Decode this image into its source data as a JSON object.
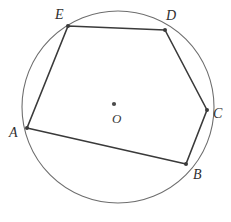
{
  "figure": {
    "type": "inscribed-polygon-in-circle",
    "background_color": "#ffffff",
    "circle": {
      "name": "circumscribed-circle",
      "center_x": 118,
      "center_y": 107,
      "radius": 96,
      "stroke_color": "#6e6e6e",
      "stroke_width": 1.1,
      "fill": "none"
    },
    "center_point": {
      "label": "O",
      "dot_x": 114,
      "dot_y": 104,
      "dot_radius": 2.1,
      "dot_color": "#4a4a4a",
      "label_x": 112,
      "label_y": 112
    },
    "polygon": {
      "name": "pentagon-ABCDE",
      "stroke_color": "#3a3a3a",
      "stroke_width": 1.6,
      "fill": "none",
      "points": "27,128 186,164 207,110 165,30 68,26",
      "vertices": [
        {
          "label": "A",
          "x": 27,
          "y": 128,
          "label_x": 9,
          "label_y": 126
        },
        {
          "label": "B",
          "x": 186,
          "y": 164,
          "label_x": 193,
          "label_y": 168
        },
        {
          "label": "C",
          "x": 207,
          "y": 110,
          "label_x": 213,
          "label_y": 107
        },
        {
          "label": "D",
          "x": 165,
          "y": 30,
          "label_x": 166,
          "label_y": 9
        },
        {
          "label": "E",
          "x": 68,
          "y": 26,
          "label_x": 55,
          "label_y": 8
        }
      ],
      "edges": [
        {
          "name": "edge-AB",
          "from": "A",
          "to": "B"
        },
        {
          "name": "edge-BC",
          "from": "B",
          "to": "C"
        },
        {
          "name": "edge-CD",
          "from": "C",
          "to": "D"
        },
        {
          "name": "edge-DE",
          "from": "D",
          "to": "E"
        },
        {
          "name": "edge-EA",
          "from": "E",
          "to": "A"
        }
      ]
    }
  }
}
